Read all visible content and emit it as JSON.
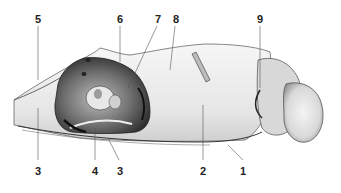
{
  "figure": {
    "type": "anatomical-illustration",
    "labels": [
      {
        "id": "5",
        "text": "5",
        "x": 38,
        "y": 14,
        "line": [
          38,
          26,
          38,
          80
        ]
      },
      {
        "id": "6",
        "text": "6",
        "x": 120,
        "y": 14,
        "line": [
          120,
          26,
          120,
          62
        ]
      },
      {
        "id": "7",
        "text": "7",
        "x": 158,
        "y": 14,
        "line": [
          157,
          26,
          128,
          88
        ]
      },
      {
        "id": "8",
        "text": "8",
        "x": 176,
        "y": 14,
        "line": [
          175,
          26,
          170,
          70
        ]
      },
      {
        "id": "9",
        "text": "9",
        "x": 260,
        "y": 14,
        "line": [
          260,
          26,
          260,
          88
        ]
      },
      {
        "id": "3a",
        "text": "3",
        "x": 38,
        "y": 166,
        "line": [
          38,
          108,
          38,
          160
        ]
      },
      {
        "id": "4",
        "text": "4",
        "x": 95,
        "y": 166,
        "line": [
          95,
          128,
          95,
          160
        ]
      },
      {
        "id": "3b",
        "text": "3",
        "x": 120,
        "y": 166,
        "line": [
          108,
          138,
          119,
          160
        ]
      },
      {
        "id": "2",
        "text": "2",
        "x": 203,
        "y": 166,
        "line": [
          203,
          105,
          203,
          160
        ]
      },
      {
        "id": "1",
        "text": "1",
        "x": 243,
        "y": 166,
        "line": [
          228,
          145,
          243,
          160
        ]
      }
    ],
    "colors": {
      "ink": "#2a2a2a",
      "shade_dark": "#3a3a3a",
      "shade_mid": "#8a8a8a",
      "shade_light": "#d6d6d6",
      "bone": "#f2f2f2"
    }
  }
}
